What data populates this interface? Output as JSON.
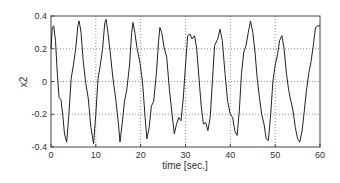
{
  "chart_data": {
    "type": "line",
    "title": "",
    "xlabel": "time [sec.]",
    "ylabel": "x2",
    "xlim": [
      0,
      60
    ],
    "ylim": [
      -0.4,
      0.4
    ],
    "xticks": [
      0,
      10,
      20,
      30,
      40,
      50,
      60
    ],
    "yticks": [
      -0.4,
      -0.2,
      0,
      0.2,
      0.4
    ],
    "xtick_labels": [
      "0",
      "10",
      "20",
      "30",
      "40",
      "50",
      "60"
    ],
    "ytick_labels": [
      "-0.4",
      "-0.2",
      "0",
      "0.2",
      "0.4"
    ],
    "grid": true,
    "grid_style": "dotted",
    "legend": null,
    "series": [
      {
        "name": "x2",
        "color": "#222222",
        "x": [
          0,
          0.3,
          0.6,
          1.0,
          1.4,
          1.8,
          2.2,
          2.6,
          3.0,
          3.5,
          4.0,
          4.5,
          5.0,
          5.5,
          6.0,
          6.3,
          6.7,
          7.2,
          7.7,
          8.3,
          8.9,
          9.5,
          10.0,
          10.5,
          11.0,
          11.5,
          12.0,
          12.3,
          12.7,
          13.2,
          13.8,
          14.4,
          15.0,
          15.4,
          15.9,
          16.4,
          16.9,
          17.5,
          18.0,
          18.3,
          18.7,
          19.2,
          19.8,
          20.4,
          21.0,
          21.4,
          21.9,
          22.4,
          22.9,
          23.5,
          24.0,
          24.3,
          24.7,
          25.2,
          25.8,
          26.4,
          27.0,
          27.5,
          28.0,
          28.5,
          29.0,
          29.5,
          30.0,
          30.5,
          31.0,
          31.5,
          32.0,
          32.5,
          33.0,
          33.5,
          34.0,
          34.5,
          35.0,
          35.5,
          36.0,
          36.5,
          37.2,
          37.7,
          38.2,
          38.8,
          39.4,
          40.0,
          40.5,
          41.0,
          41.5,
          42.0,
          42.5,
          43.0,
          43.5,
          44.0,
          44.5,
          45.0,
          45.5,
          46.0,
          46.5,
          47.0,
          47.5,
          48.0,
          48.5,
          49.0,
          49.5,
          50.0,
          50.5,
          51.0,
          51.5,
          52.0,
          52.5,
          53.0,
          53.5,
          54.0,
          54.5,
          55.0,
          55.5,
          56.0,
          56.5,
          57.0,
          57.5,
          58.0,
          58.5,
          59.0,
          59.5,
          60.0
        ],
        "values": [
          0.2,
          0.33,
          0.34,
          0.25,
          0.05,
          -0.1,
          -0.11,
          -0.2,
          -0.32,
          -0.37,
          -0.2,
          0.02,
          0.1,
          0.2,
          0.34,
          0.37,
          0.3,
          0.12,
          0.0,
          -0.1,
          -0.28,
          -0.38,
          -0.2,
          0.02,
          0.1,
          0.2,
          0.36,
          0.38,
          0.3,
          0.18,
          0.02,
          -0.1,
          -0.25,
          -0.37,
          -0.25,
          -0.12,
          -0.05,
          0.1,
          0.3,
          0.36,
          0.3,
          0.2,
          0.12,
          0.0,
          -0.22,
          -0.35,
          -0.28,
          -0.15,
          -0.12,
          0.05,
          0.25,
          0.33,
          0.3,
          0.21,
          0.15,
          -0.05,
          -0.2,
          -0.32,
          -0.26,
          -0.22,
          -0.24,
          -0.1,
          0.1,
          0.28,
          0.29,
          0.26,
          0.28,
          0.2,
          0.02,
          -0.15,
          -0.26,
          -0.25,
          -0.3,
          -0.22,
          0.0,
          0.22,
          0.26,
          0.32,
          0.25,
          0.05,
          -0.12,
          -0.2,
          -0.22,
          -0.3,
          -0.33,
          -0.18,
          0.05,
          0.18,
          0.22,
          0.3,
          0.37,
          0.3,
          0.18,
          0.02,
          -0.1,
          -0.2,
          -0.26,
          -0.35,
          -0.36,
          -0.2,
          0.0,
          0.1,
          0.16,
          0.25,
          0.28,
          0.2,
          0.05,
          -0.05,
          -0.12,
          -0.18,
          -0.28,
          -0.35,
          -0.37,
          -0.3,
          -0.18,
          -0.05,
          0.05,
          0.12,
          0.22,
          0.33,
          0.34,
          0.34
        ]
      }
    ]
  }
}
